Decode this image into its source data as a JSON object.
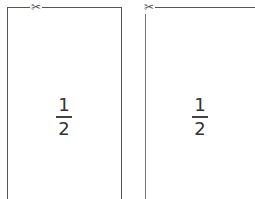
{
  "panels": [
    {
      "id": "left",
      "icon": "scissors-icon",
      "glyph": "✂",
      "fraction": {
        "numerator": "1",
        "denominator": "2"
      }
    },
    {
      "id": "right",
      "icon": "scissors-icon",
      "glyph": "✂",
      "fraction": {
        "numerator": "1",
        "denominator": "2"
      }
    }
  ],
  "colors": {
    "line": "#555555",
    "text": "#333333",
    "background": "#ffffff"
  }
}
